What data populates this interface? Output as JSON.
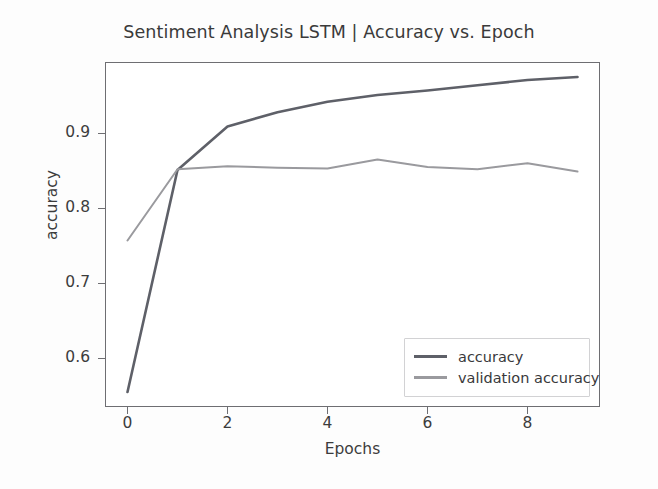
{
  "chart_data": {
    "type": "line",
    "title": "Sentiment Analysis LSTM | Accuracy vs. Epoch",
    "xlabel": "Epochs",
    "ylabel": "accuracy",
    "x": [
      0,
      1,
      2,
      3,
      4,
      5,
      6,
      7,
      8,
      9
    ],
    "xlim": [
      -0.45,
      9.45
    ],
    "ylim": [
      0.535,
      0.995
    ],
    "xticks": [
      0,
      2,
      4,
      6,
      8
    ],
    "xtick_labels": [
      "0",
      "2",
      "4",
      "6",
      "8"
    ],
    "yticks": [
      0.6,
      0.7,
      0.8,
      0.9
    ],
    "ytick_labels": [
      "0.6",
      "0.7",
      "0.8",
      "0.9"
    ],
    "grid": false,
    "legend_position": "lower right",
    "series": [
      {
        "name": "accuracy",
        "color": "#5e6068",
        "values": [
          0.555,
          0.851,
          0.909,
          0.928,
          0.942,
          0.951,
          0.957,
          0.964,
          0.971,
          0.975
        ]
      },
      {
        "name": "validation accuracy",
        "color": "#9a9a9e",
        "values": [
          0.757,
          0.852,
          0.856,
          0.854,
          0.853,
          0.865,
          0.855,
          0.852,
          0.86,
          0.849
        ]
      }
    ]
  },
  "legend": {
    "items": [
      {
        "label": "accuracy"
      },
      {
        "label": "validation accuracy"
      }
    ]
  }
}
